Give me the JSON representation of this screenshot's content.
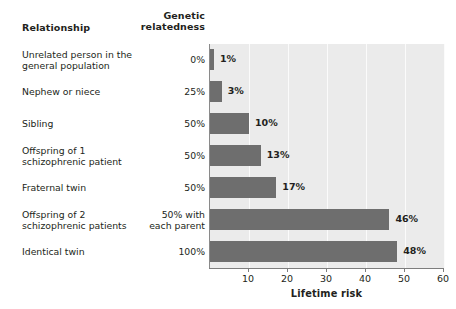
{
  "headers": {
    "relationship": "Relationship",
    "genetic_relatedness": "Genetic\nrelatedness",
    "genetic_relatedness_line1": "Genetic",
    "genetic_relatedness_line2": "relatedness"
  },
  "rows": [
    {
      "relationship": "Unrelated person in the general population",
      "relationship_line1": "Unrelated person in the",
      "relationship_line2": "general population",
      "relatedness": "0%",
      "relatedness_line1": "0%",
      "relatedness_line2": "",
      "risk_label": "1%",
      "risk": 1
    },
    {
      "relationship": "Nephew or niece",
      "relationship_line1": "Nephew or niece",
      "relationship_line2": "",
      "relatedness": "25%",
      "relatedness_line1": "25%",
      "relatedness_line2": "",
      "risk_label": "3%",
      "risk": 3
    },
    {
      "relationship": "Sibling",
      "relationship_line1": "Sibling",
      "relationship_line2": "",
      "relatedness": "50%",
      "relatedness_line1": "50%",
      "relatedness_line2": "",
      "risk_label": "10%",
      "risk": 10
    },
    {
      "relationship": "Offspring of 1 schizophrenic patient",
      "relationship_line1": "Offspring of 1",
      "relationship_line2": "schizophrenic patient",
      "relatedness": "50%",
      "relatedness_line1": "50%",
      "relatedness_line2": "",
      "risk_label": "13%",
      "risk": 13
    },
    {
      "relationship": "Fraternal twin",
      "relationship_line1": "Fraternal twin",
      "relationship_line2": "",
      "relatedness": "50%",
      "relatedness_line1": "50%",
      "relatedness_line2": "",
      "risk_label": "17%",
      "risk": 17
    },
    {
      "relationship": "Offspring of 2 schizophrenic patients",
      "relationship_line1": "Offspring of 2",
      "relationship_line2": "schizophrenic patients",
      "relatedness": "50% with each parent",
      "relatedness_line1": "50% with",
      "relatedness_line2": "each parent",
      "risk_label": "46%",
      "risk": 46
    },
    {
      "relationship": "Identical twin",
      "relationship_line1": "Identical twin",
      "relationship_line2": "",
      "relatedness": "100%",
      "relatedness_line1": "100%",
      "relatedness_line2": "",
      "risk_label": "48%",
      "risk": 48
    }
  ],
  "axis": {
    "title": "Lifetime risk",
    "ticks": [
      "10",
      "20",
      "30",
      "40",
      "50",
      "60"
    ],
    "tick_values": [
      10,
      20,
      30,
      40,
      50,
      60
    ],
    "min": 0,
    "max": 60
  },
  "colors": {
    "bar": "#6e6e6e",
    "plot_background": "#ebebeb",
    "gridline": "#fbfbfb",
    "axis": "#7d7d7d",
    "text": "#231f20",
    "page_background": "#ffffff"
  },
  "chart_data": {
    "type": "bar",
    "orientation": "horizontal",
    "title": "",
    "subtitle": "",
    "xlabel": "Lifetime risk",
    "ylabel": "",
    "xlim": [
      0,
      60
    ],
    "grid": true,
    "legend": "none",
    "categories": [
      "Unrelated person in the general population",
      "Nephew or niece",
      "Sibling",
      "Offspring of 1 schizophrenic patient",
      "Fraternal twin",
      "Offspring of 2 schizophrenic patients",
      "Identical twin"
    ],
    "values": [
      1,
      3,
      10,
      13,
      17,
      46,
      48
    ],
    "value_labels": [
      "1%",
      "3%",
      "10%",
      "13%",
      "17%",
      "46%",
      "48%"
    ],
    "genetic_relatedness": [
      "0%",
      "25%",
      "50%",
      "50%",
      "50%",
      "50% with each parent",
      "100%"
    ],
    "xticks": [
      10,
      20,
      30,
      40,
      50,
      60
    ],
    "xticklabels": [
      "10",
      "20",
      "30",
      "40",
      "50",
      "60"
    ],
    "units": "percent"
  }
}
